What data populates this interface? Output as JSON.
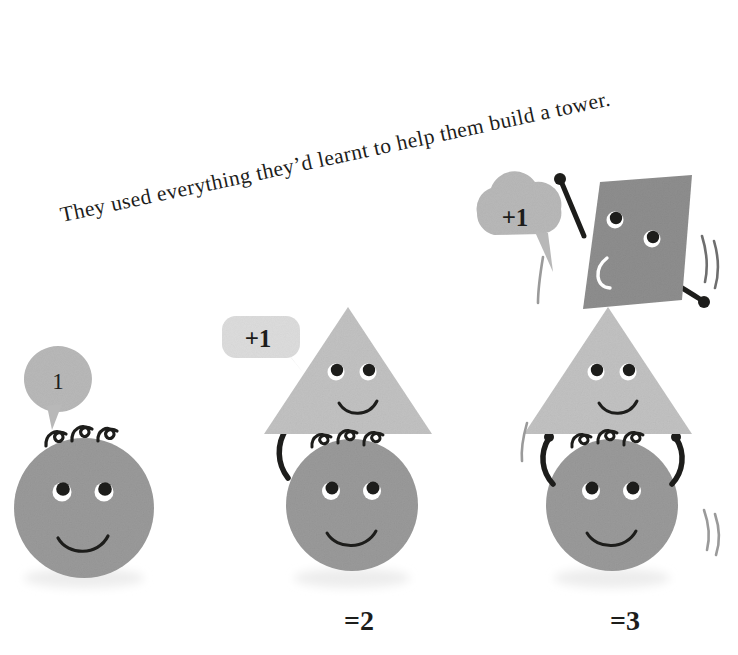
{
  "page": {
    "background_color": "#ffffff",
    "width": 738,
    "height": 655
  },
  "caption": {
    "text": "They used everything they’d learnt to help them build a tower.",
    "color": "#1d1d1b",
    "rotation_deg": -12
  },
  "palette": {
    "head_gray": "#9a9a9a",
    "triangle_gray": "#c2c2c2",
    "square_gray": "#8e8e8e",
    "bubble_gray_light": "#dcdcdc",
    "bubble_gray_mid": "#b8b8b8",
    "ink_black": "#1d1d1b",
    "eye_white": "#ffffff",
    "shadow_gray": "#e8e8e8"
  },
  "figures": [
    {
      "id": "figure-one",
      "name": "single-head-figure",
      "bubble": {
        "shape": "round",
        "label": "1",
        "color": "#b8b8b8"
      },
      "shapes": [
        "circle-head"
      ],
      "total_label": "",
      "has_arms": false
    },
    {
      "id": "figure-two",
      "name": "head-and-triangle-figure",
      "bubble": {
        "shape": "rounded-rect",
        "label": "+1",
        "color": "#dcdcdc"
      },
      "shapes": [
        "triangle",
        "circle-head"
      ],
      "total_label": "=2",
      "has_arms": true,
      "arm_count": 1
    },
    {
      "id": "figure-three",
      "name": "head-triangle-and-square-figure",
      "bubble": {
        "shape": "cloud",
        "label": "+1",
        "color": "#b8b8b8"
      },
      "shapes": [
        "tilted-square",
        "triangle",
        "circle-head"
      ],
      "total_label": "=3",
      "has_arms": true,
      "arm_count": 4,
      "motion_lines": true
    }
  ],
  "totals": {
    "figure_two": "=2",
    "figure_three": "=3"
  },
  "bubbles": {
    "one": "1",
    "plus_one_mid": "+1",
    "plus_one_right": "+1"
  }
}
